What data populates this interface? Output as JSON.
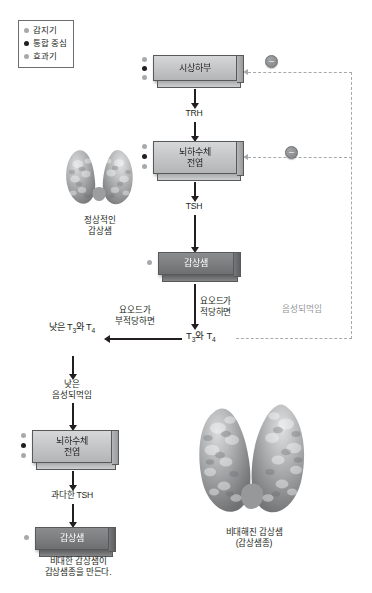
{
  "legend": {
    "items": [
      {
        "label": "감지기",
        "marker": "light"
      },
      {
        "label": "통합 중심",
        "marker": "dark"
      },
      {
        "label": "효과기",
        "marker": "light"
      }
    ]
  },
  "flow": {
    "hypothalamus": "시상하부",
    "pituitary_line1": "뇌하수체",
    "pituitary_line2": "전엽",
    "thyroid": "갑상샘",
    "trh": "TRH",
    "tsh": "TSH",
    "iodine_adequate_l1": "요오드가",
    "iodine_adequate_l2": "적당하면",
    "t3t4": "T3와 T4",
    "iodine_inadequate_l1": "요오드가",
    "iodine_inadequate_l2": "부적당하면",
    "low_t3t4_l1": "낮은",
    "low_t3t4_l2": "T3와 T4",
    "low_feedback_l1": "낮은",
    "low_feedback_l2": "음성되먹임",
    "pituitary2_line1": "뇌하수체",
    "pituitary2_line2": "전엽",
    "excess_tsh": "과다한 TSH",
    "thyroid2": "갑상샘",
    "goiter_caption_l1": "비대한 갑상샘이",
    "goiter_caption_l2": "갑상샘종을 만든다.",
    "negative_feedback": "음성되먹임",
    "minus_symbol": "–"
  },
  "organs": {
    "normal_l1": "정상적인",
    "normal_l2": "갑상샘",
    "enlarged_l1": "비대해진 갑상샘",
    "enlarged_l2": "(갑상샘종)"
  },
  "colors": {
    "line": "#231f20",
    "dashed": "#a7a9ac",
    "box_light": "#c6c7c9",
    "box_dark": "#7c7d7f"
  }
}
